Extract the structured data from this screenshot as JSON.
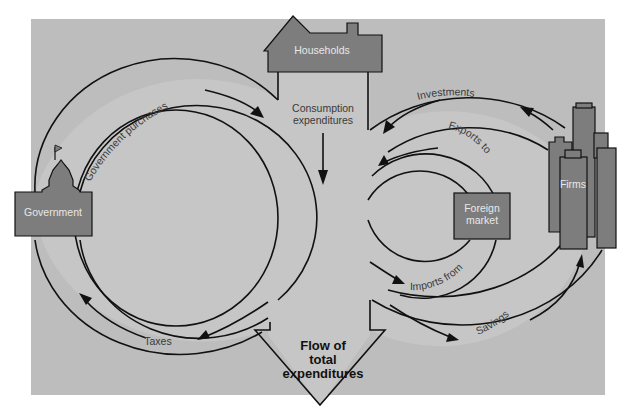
{
  "diagram": {
    "colors": {
      "background_panel": "#bdbdbd",
      "entity_fill": "#7d7d7d",
      "flow_band": "#c9c9c9",
      "stroke": "#111111"
    },
    "center_label": {
      "line1": "Flow of",
      "line2": "total",
      "line3": "expenditures"
    },
    "entities": {
      "households": "Households",
      "government": "Government",
      "firms": "Firms",
      "foreign_market_line1": "Foreign",
      "foreign_market_line2": "market"
    },
    "flows": {
      "government_purchases": "Government purchases",
      "consumption_line1": "Consumption",
      "consumption_line2": "expenditures",
      "taxes": "Taxes",
      "investments": "Investments",
      "exports_to": "Exports to",
      "imports_from": "Imports from",
      "savings": "Savings"
    }
  }
}
